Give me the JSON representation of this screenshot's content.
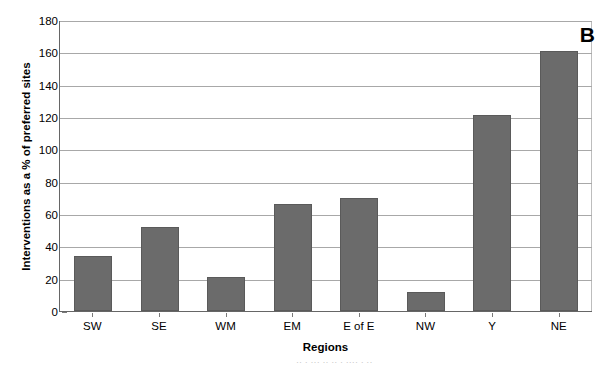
{
  "panel": {
    "letter": "B"
  },
  "chart_data": {
    "type": "bar",
    "title": "",
    "subtitle": "",
    "panel_label": "B",
    "xlabel": "Regions",
    "ylabel": "Interventions as a % of preferred sites",
    "categories": [
      "SW",
      "SE",
      "WM",
      "EM",
      "E of E",
      "NW",
      "Y",
      "NE"
    ],
    "values": [
      34,
      52,
      21,
      66,
      70,
      12,
      121,
      161
    ],
    "series": [
      {
        "name": "Interventions as a % of preferred sites",
        "values": [
          34,
          52,
          21,
          66,
          70,
          12,
          121,
          161
        ]
      }
    ],
    "ylim": [
      0,
      180
    ],
    "yticks": [
      0,
      20,
      40,
      60,
      80,
      100,
      120,
      140,
      160,
      180
    ],
    "ytick_labels": [
      "0",
      "20",
      "40",
      "60",
      "80",
      "100",
      "120",
      "140",
      "160",
      "180"
    ],
    "grid": true,
    "grid_axis": "y",
    "legend": false,
    "legend_position": "none",
    "bar_color": "#6b6b6b",
    "bar_edge_color": "#5a5a5a",
    "grid_color": "#a8a8a8",
    "axis_color": "#666666",
    "background_color": "#ffffff"
  },
  "caption_sliver": {
    "text": "··  ·   ···   ·· ··  · ····  ·  ··"
  }
}
